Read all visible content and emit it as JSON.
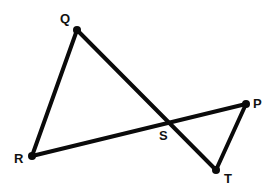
{
  "diagram": {
    "type": "geometry",
    "points": {
      "Q": {
        "label": "Q",
        "x": 77,
        "y": 30,
        "lx": 60,
        "ly": 23
      },
      "R": {
        "label": "R",
        "x": 32,
        "y": 156,
        "lx": 14,
        "ly": 163
      },
      "P": {
        "label": "P",
        "x": 246,
        "y": 104,
        "lx": 253,
        "ly": 108
      },
      "T": {
        "label": "T",
        "x": 216,
        "y": 170,
        "lx": 224,
        "ly": 183
      },
      "S": {
        "label": "S",
        "x": 169,
        "y": 122,
        "lx": 159,
        "ly": 140
      }
    },
    "segments": [
      {
        "from": "Q",
        "to": "R"
      },
      {
        "from": "Q",
        "to": "T"
      },
      {
        "from": "R",
        "to": "P"
      },
      {
        "from": "P",
        "to": "T"
      }
    ],
    "stroke_color": "#0a0a0a",
    "background": "#ffffff"
  }
}
